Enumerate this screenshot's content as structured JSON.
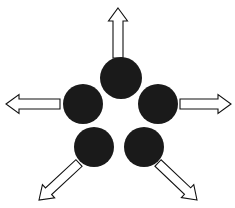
{
  "figure": {
    "width": 235,
    "height": 208,
    "background_color": "#ffffff"
  },
  "style": {
    "circle_fill": "#1a1a1a",
    "arrow_fill": "#ffffff",
    "arrow_stroke": "#111111",
    "arrow_stroke_width": 1.1
  },
  "nodes": [
    {
      "id": "node-top",
      "label": "",
      "cx": 121,
      "cy": 78,
      "r": 21
    },
    {
      "id": "node-left",
      "label": "",
      "cx": 83,
      "cy": 104,
      "r": 20
    },
    {
      "id": "node-right",
      "label": "",
      "cx": 158,
      "cy": 104,
      "r": 20
    },
    {
      "id": "node-bottom-left",
      "label": "",
      "cx": 94,
      "cy": 147,
      "r": 20
    },
    {
      "id": "node-bottom-right",
      "label": "",
      "cx": 144,
      "cy": 147,
      "r": 20
    }
  ],
  "arrows": [
    {
      "id": "arrow-up",
      "direction": "up",
      "angle_deg": 90,
      "tip": {
        "x": 118,
        "y": 8
      },
      "tail": {
        "x": 118,
        "y": 58
      },
      "shaft_width": 10,
      "head_width": 19,
      "head_length": 13
    },
    {
      "id": "arrow-left",
      "direction": "left",
      "angle_deg": 180,
      "tip": {
        "x": 6,
        "y": 104
      },
      "tail": {
        "x": 60,
        "y": 104
      },
      "shaft_width": 10,
      "head_width": 19,
      "head_length": 13
    },
    {
      "id": "arrow-right",
      "direction": "right",
      "angle_deg": 0,
      "tip": {
        "x": 231,
        "y": 104
      },
      "tail": {
        "x": 180,
        "y": 104
      },
      "shaft_width": 10,
      "head_width": 19,
      "head_length": 13
    },
    {
      "id": "arrow-down-left",
      "direction": "down-left",
      "angle_deg": 225,
      "tip": {
        "x": 39,
        "y": 200
      },
      "tail": {
        "x": 79,
        "y": 163
      },
      "shaft_width": 9,
      "head_width": 18,
      "head_length": 13
    },
    {
      "id": "arrow-down-right",
      "direction": "down-right",
      "angle_deg": 315,
      "tip": {
        "x": 197,
        "y": 200
      },
      "tail": {
        "x": 158,
        "y": 163
      },
      "shaft_width": 9,
      "head_width": 18,
      "head_length": 13
    }
  ]
}
